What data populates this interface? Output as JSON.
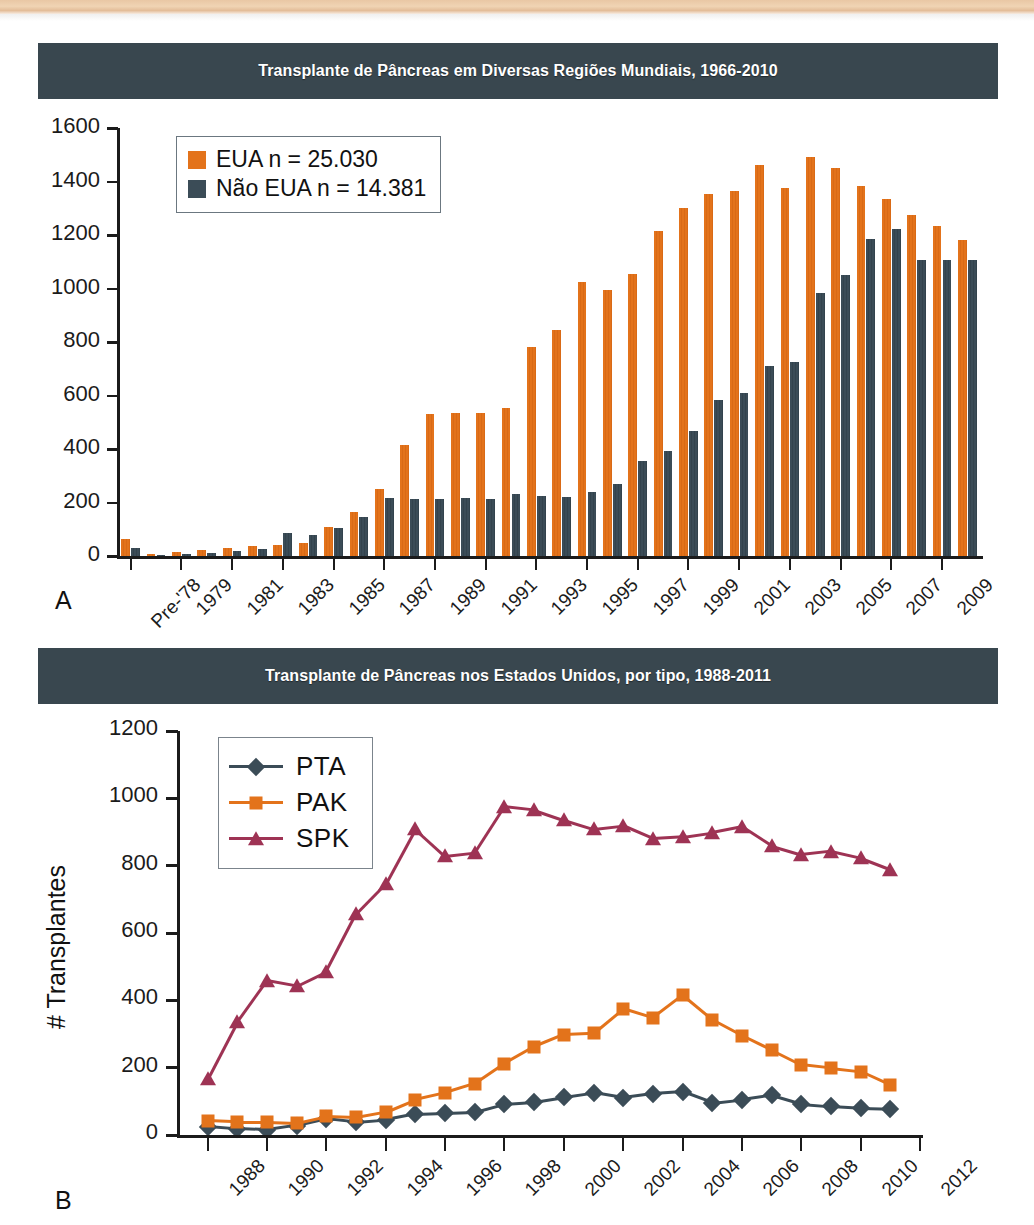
{
  "page": {
    "panel_a_letter": "A",
    "panel_b_letter": "B"
  },
  "colors": {
    "banner_bg": "#39474f",
    "banner_text": "#ffffff",
    "eua_orange": "#e3731b",
    "nao_eua_slate": "#3b4c57",
    "pta_slate": "#3b4c57",
    "pak_orange": "#e3731b",
    "spk_maroon": "#9e3354",
    "axis": "#1b1b1b",
    "page_edge": "#e9c7a4"
  },
  "chart_a": {
    "title": "Transplante de Pâncreas em Diversas Regiões Mundiais, 1966-2010",
    "legend": [
      {
        "label": "EUA n = 25.030",
        "color": "#e3731b"
      },
      {
        "label": "Não EUA n = 14.381",
        "color": "#3b4c57"
      }
    ],
    "ytick_labels": [
      "1600",
      "1400",
      "1200",
      "1000",
      "800",
      "600",
      "400",
      "200",
      "0"
    ],
    "xtick_labels": [
      "Pre-'78",
      "1979",
      "1981",
      "1983",
      "1985",
      "1987",
      "1989",
      "1991",
      "1993",
      "1995",
      "1997",
      "1999",
      "2001",
      "2003",
      "2005",
      "2007",
      "2009"
    ]
  },
  "chart_b": {
    "title": "Transplante de Pâncreas nos Estados Unidos, por tipo, 1988-2011",
    "ylabel": "# Transplantes",
    "legend": [
      {
        "label": "PTA",
        "color": "#3b4c57",
        "marker": "diamond"
      },
      {
        "label": "PAK",
        "color": "#e3731b",
        "marker": "square"
      },
      {
        "label": "SPK",
        "color": "#9e3354",
        "marker": "triangle"
      }
    ],
    "ytick_labels": [
      "1200",
      "1000",
      "800",
      "600",
      "400",
      "200",
      "0"
    ],
    "xtick_labels": [
      "1988",
      "1990",
      "1992",
      "1994",
      "1996",
      "1998",
      "2000",
      "2002",
      "2004",
      "2006",
      "2008",
      "2010",
      "2012"
    ]
  },
  "chart_data": [
    {
      "type": "bar",
      "id": "chart-a",
      "title": "Transplante de Pâncreas em Diversas Regiões Mundiais, 1966-2010",
      "xlabel": "",
      "ylabel": "",
      "ylim": [
        0,
        1600
      ],
      "ytick_step": 200,
      "grid": false,
      "legend_position": "top-left",
      "categories": [
        "Pre-'78",
        "1978",
        "1979",
        "1980",
        "1981",
        "1982",
        "1983",
        "1984",
        "1985",
        "1986",
        "1987",
        "1988",
        "1989",
        "1990",
        "1991",
        "1992",
        "1993",
        "1994",
        "1995",
        "1996",
        "1997",
        "1998",
        "1999",
        "2000",
        "2001",
        "2002",
        "2003",
        "2004",
        "2005",
        "2006",
        "2007",
        "2008",
        "2009",
        "2010"
      ],
      "series": [
        {
          "name": "EUA n = 25.030",
          "color": "#e3731b",
          "values": [
            65,
            8,
            14,
            22,
            30,
            38,
            42,
            50,
            110,
            165,
            250,
            415,
            530,
            535,
            535,
            555,
            780,
            845,
            1025,
            995,
            1055,
            1215,
            1300,
            1355,
            1365,
            1460,
            1375,
            1490,
            1450,
            1385,
            1335,
            1275,
            1235,
            1180
          ]
        },
        {
          "name": "Não EUA n = 14.381",
          "color": "#3b4c57",
          "values": [
            30,
            5,
            8,
            12,
            18,
            28,
            85,
            80,
            105,
            145,
            218,
            215,
            213,
            218,
            212,
            232,
            225,
            220,
            238,
            268,
            355,
            392,
            468,
            585,
            610,
            712,
            727,
            985,
            1050,
            1185,
            1222,
            1105,
            1108,
            1105
          ]
        }
      ]
    },
    {
      "type": "line",
      "id": "chart-b",
      "title": "Transplante de Pâncreas nos Estados Unidos, por tipo, 1988-2011",
      "xlabel": "",
      "ylabel": "# Transplantes",
      "ylim": [
        0,
        1200
      ],
      "ytick_step": 200,
      "xlim": [
        1987,
        2012
      ],
      "grid": false,
      "legend_position": "top-left",
      "x": [
        1988,
        1989,
        1990,
        1991,
        1992,
        1993,
        1994,
        1995,
        1996,
        1997,
        1998,
        1999,
        2000,
        2001,
        2002,
        2003,
        2004,
        2005,
        2006,
        2007,
        2008,
        2009,
        2010,
        2011
      ],
      "series": [
        {
          "name": "PTA",
          "color": "#3b4c57",
          "marker": "diamond",
          "values": [
            25,
            18,
            15,
            28,
            48,
            38,
            45,
            62,
            65,
            68,
            92,
            98,
            112,
            125,
            110,
            122,
            128,
            95,
            105,
            118,
            92,
            85,
            80,
            78
          ]
        },
        {
          "name": "PAK",
          "color": "#e3731b",
          "marker": "square",
          "values": [
            42,
            38,
            38,
            35,
            55,
            52,
            68,
            105,
            125,
            152,
            212,
            262,
            298,
            302,
            375,
            348,
            415,
            342,
            295,
            252,
            208,
            198,
            188,
            148
          ]
        },
        {
          "name": "SPK",
          "color": "#9e3354",
          "marker": "triangle",
          "values": [
            165,
            335,
            458,
            442,
            485,
            655,
            745,
            908,
            828,
            838,
            975,
            965,
            935,
            908,
            918,
            880,
            885,
            898,
            915,
            858,
            832,
            842,
            822,
            788
          ]
        }
      ]
    }
  ]
}
